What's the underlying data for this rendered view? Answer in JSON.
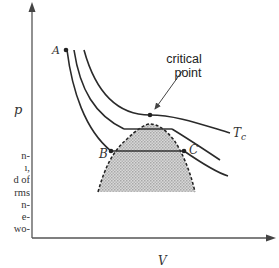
{
  "diagram": {
    "type": "pV phase diagram (isotherms with liquid-vapor coexistence region)",
    "axes": {
      "y_label": "p",
      "x_label": "V"
    },
    "points": {
      "A": "A",
      "B": "B",
      "C": "C"
    },
    "isotherm_label": "Tc",
    "isotherm_label_main": "T",
    "isotherm_label_sub": "c",
    "annotation": {
      "line1": "critical",
      "line2": "point"
    },
    "colors": {
      "ink": "#2a2a2a",
      "shade": "#c8c8c8",
      "axis": "#555555"
    }
  },
  "cropped_text": {
    "lines": [
      "n-",
      "ı,",
      "d of",
      "rms",
      "n-",
      "e-",
      "wo-"
    ]
  }
}
